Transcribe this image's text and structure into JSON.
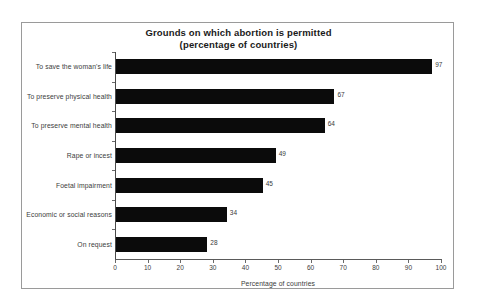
{
  "chart_data": {
    "type": "bar",
    "orientation": "horizontal",
    "title": "Grounds on which abortion is permitted",
    "subtitle": "(percentage of countries)",
    "xlabel": "Percentage of countries",
    "ylabel": "",
    "xlim": [
      0,
      100
    ],
    "xticks": [
      0,
      10,
      20,
      30,
      40,
      50,
      60,
      70,
      80,
      90,
      100
    ],
    "grid": false,
    "legend": false,
    "bar_color": "#0b0b0b",
    "categories": [
      "To save the woman's life",
      "To preserve physical health",
      "To preserve mental health",
      "Rape or incest",
      "Foetal impairment",
      "Economic or social reasons",
      "On request"
    ],
    "values": [
      97,
      67,
      64,
      49,
      45,
      34,
      28
    ],
    "value_labels": [
      "97",
      "67",
      "64",
      "49",
      "45",
      "34",
      "28"
    ],
    "tick_labels": [
      "0",
      "10",
      "20",
      "30",
      "40",
      "50",
      "60",
      "70",
      "80",
      "90",
      "100"
    ]
  }
}
